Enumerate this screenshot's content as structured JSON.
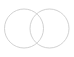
{
  "canvas": {
    "width": 74,
    "height": 57,
    "background_color": "#ffffff",
    "name": "two-overlapping-circles-diagram"
  },
  "diagram": {
    "type": "venn-two-set",
    "title": "",
    "stroke_color": "#cccccc",
    "stroke_width": 0.9,
    "fill": "none",
    "shapes": [
      {
        "id": "left-circle",
        "label": "",
        "cx": 24,
        "cy": 28.5,
        "r": 19.5,
        "stroke_color": "#cccccc",
        "stroke_width": 0.9,
        "fill": "none"
      },
      {
        "id": "right-circle",
        "label": "",
        "cx": 49.5,
        "cy": 28.5,
        "r": 19.5,
        "stroke_color": "#cccccc",
        "stroke_width": 0.9,
        "fill": "none"
      }
    ],
    "intersection": {
      "id": "lens-overlap",
      "label": "",
      "upper_crossing_x": 37,
      "upper_crossing_y": 10,
      "lower_crossing_x": 37,
      "lower_crossing_y": 47
    }
  }
}
